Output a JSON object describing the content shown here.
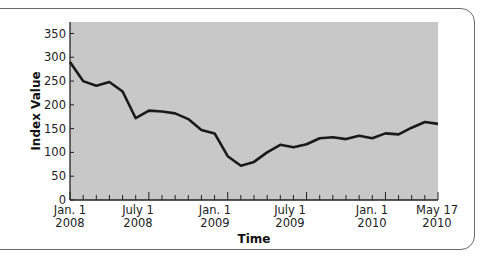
{
  "chart_data": {
    "type": "line",
    "title": "",
    "xlabel": "Time",
    "ylabel": "Index Value",
    "ylim": [
      0,
      350
    ],
    "yticks": [
      0,
      50,
      100,
      150,
      200,
      250,
      300,
      350
    ],
    "xtick_labels": [
      {
        "line1": "Jan. 1",
        "line2": "2008"
      },
      {
        "line1": "July 1",
        "line2": "2008"
      },
      {
        "line1": "Jan. 1",
        "line2": "2009"
      },
      {
        "line1": "July 1",
        "line2": "2009"
      },
      {
        "line1": "Jan. 1",
        "line2": "2010"
      },
      {
        "line1": "May 17",
        "line2": "2010"
      }
    ],
    "grid": false,
    "legend": null,
    "series": [
      {
        "name": "Index Value",
        "values": [
          290,
          250,
          240,
          248,
          228,
          172,
          188,
          186,
          182,
          170,
          147,
          140,
          92,
          72,
          80,
          100,
          116,
          111,
          117,
          130,
          132,
          128,
          135,
          130,
          140,
          138,
          152,
          164,
          160
        ]
      }
    ],
    "colors": {
      "plot_background": "#c8c8c8",
      "line": "#1a1a1a",
      "frame": "#6a6a6a"
    }
  }
}
